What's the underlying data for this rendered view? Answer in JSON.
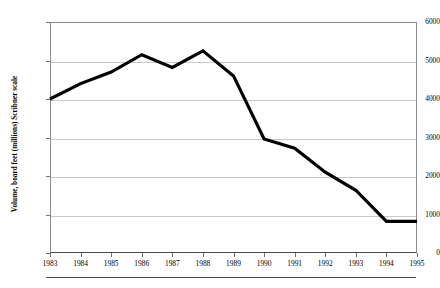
{
  "chart_data": {
    "type": "line",
    "title": "",
    "xlabel": "",
    "ylabel": "Volume, board feet (millions) Scribner scale",
    "categories": [
      "1983",
      "1984",
      "1985",
      "1986",
      "1987",
      "1988",
      "1989",
      "1990",
      "1991",
      "1992",
      "1993",
      "1994",
      "1995"
    ],
    "x": [
      1983,
      1984,
      1985,
      1986,
      1987,
      1988,
      1989,
      1990,
      1991,
      1992,
      1993,
      1994,
      1995
    ],
    "values": [
      4000,
      4400,
      4700,
      5150,
      4820,
      5250,
      4600,
      2960,
      2720,
      2100,
      1630,
      820,
      820
    ],
    "xlim": [
      1983,
      1995
    ],
    "ylim": [
      0,
      6000
    ],
    "ytick_labels": [
      "0",
      "1000",
      "2000",
      "3000",
      "4000",
      "5000",
      "6000"
    ],
    "yticks": [
      0,
      1000,
      2000,
      3000,
      4000,
      5000,
      6000
    ],
    "xtick_labels": [
      "1983",
      "1984",
      "1985",
      "1986",
      "1987",
      "1988",
      "1989",
      "1990",
      "1991",
      "1992",
      "1993",
      "1994",
      "1995"
    ],
    "grid": "horizontal",
    "legend": "none",
    "series_color": "#000000",
    "grid_color": "#c9c9c9",
    "axis_color": "#8c8c8c",
    "background": "#ffffff"
  }
}
